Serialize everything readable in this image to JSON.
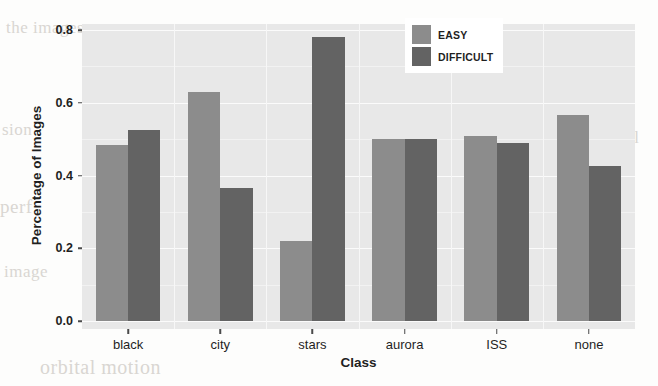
{
  "chart_data": {
    "type": "bar",
    "title": "",
    "xlabel": "Class",
    "ylabel": "Percentage of Images",
    "categories": [
      "black",
      "city",
      "stars",
      "aurora",
      "ISS",
      "none"
    ],
    "series": [
      {
        "name": "EASY",
        "color": "#8c8c8c",
        "values": [
          0.485,
          0.63,
          0.22,
          0.5,
          0.51,
          0.565
        ]
      },
      {
        "name": "DIFFICULT",
        "color": "#636363",
        "values": [
          0.525,
          0.365,
          0.78,
          0.5,
          0.49,
          0.425
        ]
      }
    ],
    "ylim": [
      0.0,
      0.8
    ],
    "yticks": [
      "0.0",
      "0.2",
      "0.4",
      "0.6",
      "0.8"
    ],
    "ytick_values": [
      0.0,
      0.2,
      0.4,
      0.6,
      0.8
    ],
    "grid": true,
    "legend_position": "top-right",
    "panel_background": "#e8e8e8",
    "gridline_color": "#fbfbfb"
  },
  "legend": {
    "entries": [
      {
        "label": "EASY"
      },
      {
        "label": "DIFFICULT"
      }
    ]
  },
  "page_bleed": {
    "b1": "the images",
    "b2": "sion",
    "b3": "perf",
    "b4": "image",
    "b5": "inal",
    "b6": "cu",
    "b7": "orbital motion"
  }
}
